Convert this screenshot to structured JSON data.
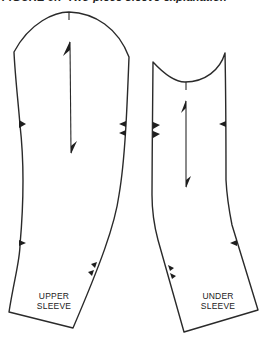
{
  "figure": {
    "caption_partial": "FIGURE 9.7 Two-piece sleeve explanation"
  },
  "pieces": [
    {
      "id": "upper-sleeve",
      "label_lines": [
        "UPPER",
        "SLEEVE"
      ],
      "notches": {
        "front_single": 1,
        "back_double": 1,
        "lower_single": 1,
        "lower_double": 1
      },
      "grainline": "double-arrow"
    },
    {
      "id": "under-sleeve",
      "label_lines": [
        "UNDER",
        "SLEEVE"
      ],
      "notches": {
        "front_double": 1,
        "back_single": 1,
        "lower_double": 1,
        "lower_single": 1
      },
      "grainline": "double-arrow"
    }
  ]
}
